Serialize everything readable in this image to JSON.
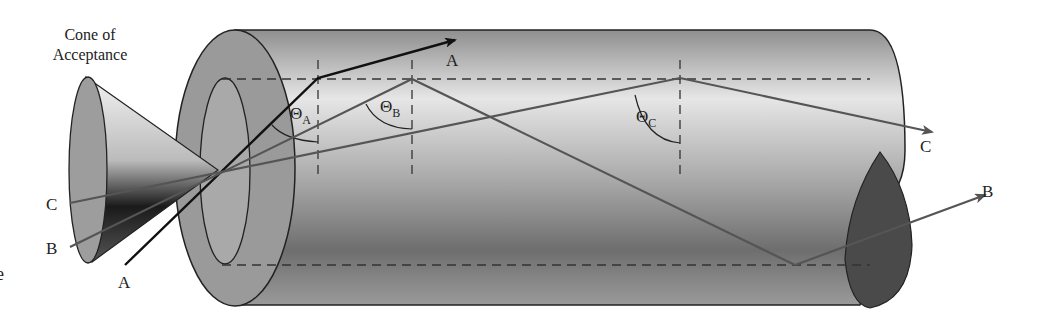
{
  "diagram": {
    "title_line1": "Cone of",
    "title_line2": "Acceptance",
    "cropped_edge_glyph": "e",
    "rays": [
      {
        "id": "A",
        "label_in": "A",
        "label_out": "A",
        "angle_symbol": "Θ",
        "angle_subscript": "A"
      },
      {
        "id": "B",
        "label_in": "B",
        "label_out": "B",
        "angle_symbol": "Θ",
        "angle_subscript": "B"
      },
      {
        "id": "C",
        "label_in": "C",
        "label_out": "C",
        "angle_symbol": "Θ",
        "angle_subscript": "C"
      }
    ],
    "colors": {
      "fiber_body": "#9a9a9a",
      "ray_a": "#111111",
      "ray_bc": "#555555",
      "end_cap": "#4a4a4a"
    }
  }
}
